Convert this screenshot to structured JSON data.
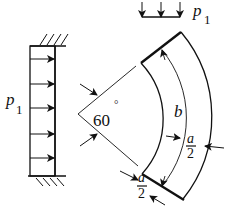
{
  "diagram": {
    "left_load": {
      "label": "p",
      "subscript": "1",
      "arrow_count": 5,
      "arrow_direction": "right",
      "support": "fixed-hatched top and bottom"
    },
    "top_load": {
      "label": "p",
      "subscript": "1",
      "arrow_count": 3,
      "arrow_direction": "down"
    },
    "angle_label": "60",
    "angle_unit": "°",
    "arc_length_label": "b",
    "width_label_right": {
      "numerator": "a",
      "denominator": "2"
    },
    "width_label_bottom": {
      "numerator": "a",
      "denominator": "2"
    },
    "colors": {
      "ink": "#111111",
      "background": "#ffffff"
    }
  }
}
